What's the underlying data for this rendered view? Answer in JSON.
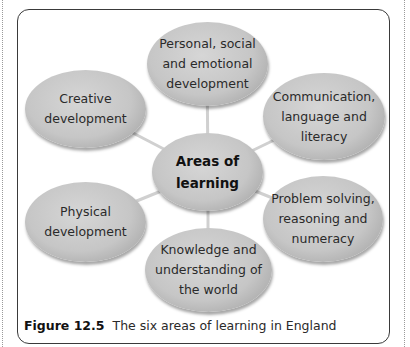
{
  "diagram": {
    "center": {
      "label": "Areas of\nlearning"
    },
    "nodes": [
      {
        "id": "personal",
        "label": "Personal, social\nand emotional\ndevelopment"
      },
      {
        "id": "communication",
        "label": "Communication,\nlanguage and\nliteracy"
      },
      {
        "id": "problem",
        "label": "Problem solving,\nreasoning and\nnumeracy"
      },
      {
        "id": "knowledge",
        "label": "Knowledge and\nunderstanding of\nthe world"
      },
      {
        "id": "physical",
        "label": "Physical\ndevelopment"
      },
      {
        "id": "creative",
        "label": "Creative\ndevelopment"
      }
    ],
    "colors": {
      "node_fill": "#c6c6c6",
      "connector": "#d0d0d0",
      "frame": "#3a3a3a"
    }
  },
  "caption": {
    "figure_label": "Figure 12.5",
    "text": "The six areas of learning in England"
  }
}
